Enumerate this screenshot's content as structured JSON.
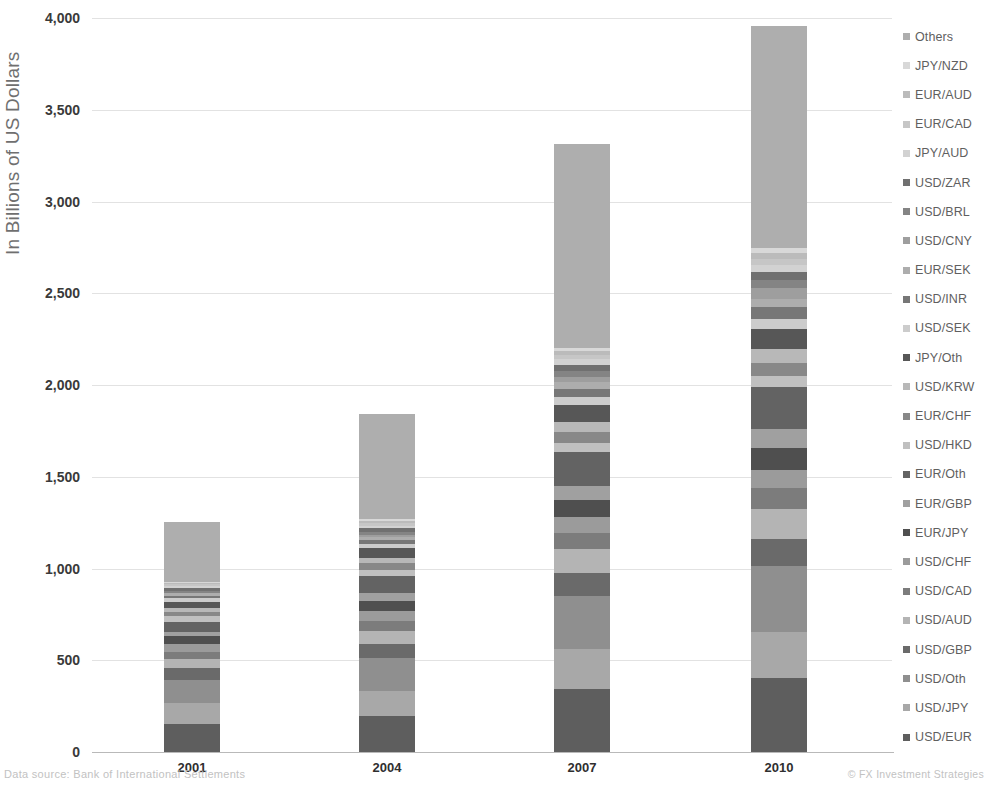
{
  "chart_data": {
    "type": "bar",
    "stacked": true,
    "title": "",
    "xlabel": "",
    "ylabel": "In Billions of US Dollars",
    "categories": [
      "2001",
      "2004",
      "2007",
      "2010"
    ],
    "ylim": [
      0,
      4000
    ],
    "yticks": [
      0,
      500,
      1000,
      1500,
      2000,
      2500,
      3000,
      3500,
      4000
    ],
    "ytick_labels": [
      "0",
      "500",
      "1,000",
      "1,500",
      "2,000",
      "2,500",
      "3,000",
      "3,500",
      "4,000"
    ],
    "grid": true,
    "legend_position": "right",
    "legend_order_top_to_bottom": [
      "Others",
      "JPY/NZD",
      "EUR/AUD",
      "EUR/CAD",
      "JPY/AUD",
      "USD/ZAR",
      "USD/BRL",
      "USD/CNY",
      "EUR/SEK",
      "USD/INR",
      "USD/SEK",
      "JPY/Oth",
      "USD/KRW",
      "EUR/CHF",
      "USD/HKD",
      "EUR/Oth",
      "EUR/GBP",
      "EUR/JPY",
      "USD/CHF",
      "USD/CAD",
      "USD/AUD",
      "USD/GBP",
      "USD/Oth",
      "USD/JPY",
      "USD/EUR"
    ],
    "totals": [
      1255,
      1925,
      3310,
      3960
    ],
    "series": [
      {
        "name": "USD/EUR",
        "color": "#5e5e5e",
        "values": [
          155,
          195,
          345,
          405
        ]
      },
      {
        "name": "USD/JPY",
        "color": "#a8a8a8",
        "values": [
          110,
          140,
          215,
          250
        ]
      },
      {
        "name": "USD/Oth",
        "color": "#8f8f8f",
        "values": [
          130,
          175,
          290,
          360
        ]
      },
      {
        "name": "USD/GBP",
        "color": "#6a6a6a",
        "values": [
          65,
          80,
          125,
          145
        ]
      },
      {
        "name": "USD/AUD",
        "color": "#b4b4b4",
        "values": [
          45,
          70,
          130,
          165
        ]
      },
      {
        "name": "USD/CAD",
        "color": "#7c7c7c",
        "values": [
          40,
          55,
          90,
          115
        ]
      },
      {
        "name": "USD/CHF",
        "color": "#9b9b9b",
        "values": [
          45,
          55,
          85,
          95
        ]
      },
      {
        "name": "EUR/JPY",
        "color": "#4f4f4f",
        "values": [
          40,
          55,
          95,
          120
        ]
      },
      {
        "name": "EUR/GBP",
        "color": "#a0a0a0",
        "values": [
          25,
          40,
          75,
          105
        ]
      },
      {
        "name": "EUR/Oth",
        "color": "#636363",
        "values": [
          55,
          95,
          185,
          230
        ]
      },
      {
        "name": "USD/HKD",
        "color": "#c0c0c0",
        "values": [
          30,
          35,
          50,
          60
        ]
      },
      {
        "name": "EUR/CHF",
        "color": "#888888",
        "values": [
          25,
          35,
          60,
          70
        ]
      },
      {
        "name": "USD/KRW",
        "color": "#b8b8b8",
        "values": [
          20,
          30,
          55,
          75
        ]
      },
      {
        "name": "JPY/Oth",
        "color": "#575757",
        "values": [
          35,
          50,
          90,
          110
        ]
      },
      {
        "name": "USD/SEK",
        "color": "#cccccc",
        "values": [
          20,
          25,
          45,
          55
        ]
      },
      {
        "name": "USD/INR",
        "color": "#777777",
        "values": [
          10,
          20,
          45,
          65
        ]
      },
      {
        "name": "EUR/SEK",
        "color": "#adadad",
        "values": [
          15,
          20,
          35,
          45
        ]
      },
      {
        "name": "USD/CNY",
        "color": "#9e9e9e",
        "values": [
          5,
          10,
          30,
          60
        ]
      },
      {
        "name": "USD/BRL",
        "color": "#848484",
        "values": [
          10,
          15,
          30,
          45
        ]
      },
      {
        "name": "USD/ZAR",
        "color": "#707070",
        "values": [
          15,
          20,
          35,
          40
        ]
      },
      {
        "name": "JPY/AUD",
        "color": "#d2d2d2",
        "values": [
          10,
          15,
          30,
          40
        ]
      },
      {
        "name": "EUR/CAD",
        "color": "#c6c6c6",
        "values": [
          10,
          15,
          25,
          35
        ]
      },
      {
        "name": "EUR/AUD",
        "color": "#bbbbbb",
        "values": [
          8,
          12,
          22,
          32
        ]
      },
      {
        "name": "JPY/NZD",
        "color": "#d8d8d8",
        "values": [
          7,
          10,
          18,
          28
        ]
      },
      {
        "name": "Others",
        "color": "#aeaeae",
        "values": [
          325,
          573,
          1109,
          1208
        ]
      }
    ]
  },
  "footer": {
    "source": "Data source: Bank of International Settlements",
    "credit": "© FX Investment Strategies"
  }
}
